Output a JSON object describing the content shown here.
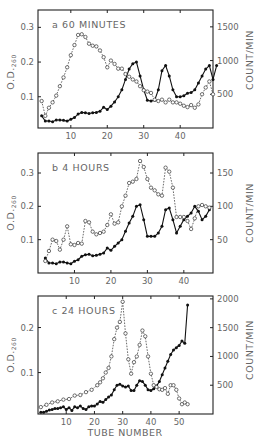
{
  "figure": {
    "x_axis_label": "TUBE NUMBER",
    "left_axis_label_main": "O.D.",
    "left_axis_label_sub": "260",
    "right_axis_label": "COUNT/MIN"
  },
  "chart_data": [
    {
      "type": "line",
      "panel": "a",
      "title": "a  60 MINUTES",
      "xlabel": "",
      "ylabel": "O.D.260",
      "y2label": "COUNT/MIN",
      "xlim": [
        1,
        49
      ],
      "ylim": [
        0.01,
        0.35
      ],
      "y2lim": [
        0,
        1750
      ],
      "x_ticks": [
        10,
        20,
        30,
        40
      ],
      "y_ticks": [
        0.1,
        0.2,
        0.3
      ],
      "y2_ticks": [
        500,
        1000,
        1500
      ],
      "series": [
        {
          "name": "O.D. 260 (filled circles, solid line)",
          "axis": "left",
          "style": "solid-filled",
          "x": [
            2,
            3,
            4,
            5,
            6,
            7,
            8,
            9,
            10,
            11,
            12,
            13,
            14,
            15,
            16,
            17,
            18,
            19,
            20,
            21,
            22,
            23,
            24,
            25,
            26,
            27,
            28,
            29,
            30,
            31,
            32,
            33,
            34,
            35,
            36,
            37,
            38,
            39,
            40,
            41,
            42,
            43,
            44,
            45,
            46,
            47,
            48,
            49,
            50
          ],
          "y": [
            0.045,
            0.03,
            0.03,
            0.028,
            0.033,
            0.033,
            0.032,
            0.03,
            0.035,
            0.04,
            0.05,
            0.055,
            0.054,
            0.052,
            0.054,
            0.055,
            0.058,
            0.07,
            0.063,
            0.073,
            0.085,
            0.1,
            0.12,
            0.15,
            0.18,
            0.195,
            0.2,
            0.16,
            0.12,
            0.09,
            0.088,
            0.09,
            0.12,
            0.175,
            0.19,
            0.16,
            0.12,
            0.1,
            0.1,
            0.103,
            0.11,
            0.112,
            0.12,
            0.14,
            0.16,
            0.18,
            0.19,
            0.15,
            0.19
          ]
        },
        {
          "name": "Count/min (open circles, dashed line)",
          "axis": "right",
          "style": "dashed-open",
          "x": [
            2,
            3,
            4,
            5,
            6,
            7,
            8,
            9,
            10,
            11,
            12,
            13,
            14,
            15,
            16,
            17,
            18,
            19,
            20,
            21,
            22,
            23,
            24,
            25,
            26,
            27,
            28,
            29,
            30,
            31,
            32,
            33,
            34,
            35,
            36,
            37,
            38,
            39,
            40,
            41,
            42,
            43,
            44,
            45,
            46,
            47,
            48,
            49
          ],
          "y": [
            400,
            180,
            300,
            380,
            480,
            620,
            750,
            900,
            1080,
            1230,
            1380,
            1390,
            1350,
            1250,
            1220,
            1210,
            1150,
            1050,
            900,
            1000,
            950,
            880,
            880,
            800,
            760,
            720,
            690,
            620,
            560,
            540,
            520,
            420,
            400,
            420,
            380,
            420,
            380,
            380,
            360,
            330,
            310,
            340,
            300,
            350,
            500,
            600,
            690,
            500
          ]
        }
      ]
    },
    {
      "type": "line",
      "panel": "b",
      "title": "b  4 HOURS",
      "xlabel": "",
      "ylabel": "O.D.260",
      "y2label": "COUNT/MIN",
      "xlim": [
        0,
        48
      ],
      "ylim": [
        0,
        0.36
      ],
      "y2lim": [
        0,
        180
      ],
      "x_ticks": [
        10,
        20,
        30,
        40
      ],
      "y_ticks": [
        0.1,
        0.2,
        0.3
      ],
      "y2_ticks": [
        50,
        100,
        150
      ],
      "series": [
        {
          "name": "O.D. 260 (filled circles, solid line)",
          "axis": "left",
          "style": "solid-filled",
          "x": [
            2,
            3,
            4,
            5,
            6,
            7,
            8,
            9,
            10,
            11,
            12,
            13,
            14,
            15,
            16,
            17,
            18,
            19,
            20,
            21,
            22,
            23,
            24,
            25,
            26,
            27,
            28,
            29,
            30,
            31,
            32,
            33,
            34,
            35,
            36,
            37,
            38,
            39,
            40,
            41,
            42,
            43,
            44,
            45,
            46,
            47
          ],
          "y": [
            0.045,
            0.03,
            0.03,
            0.028,
            0.033,
            0.033,
            0.03,
            0.028,
            0.035,
            0.04,
            0.05,
            0.055,
            0.056,
            0.052,
            0.053,
            0.056,
            0.06,
            0.075,
            0.068,
            0.08,
            0.09,
            0.1,
            0.125,
            0.15,
            0.17,
            0.2,
            0.205,
            0.16,
            0.11,
            0.11,
            0.11,
            0.12,
            0.14,
            0.19,
            0.195,
            0.16,
            0.12,
            0.14,
            0.16,
            0.17,
            0.18,
            0.2,
            0.185,
            0.16,
            0.17,
            0.19
          ]
        },
        {
          "name": "Count/min (open circles, dashed line)",
          "axis": "right",
          "style": "dashed-open",
          "x": [
            2,
            3,
            4,
            5,
            6,
            7,
            8,
            9,
            10,
            11,
            12,
            13,
            14,
            15,
            16,
            17,
            18,
            19,
            20,
            21,
            22,
            23,
            24,
            25,
            26,
            27,
            28,
            29,
            30,
            31,
            32,
            33,
            34,
            35,
            36,
            37,
            38,
            39,
            40,
            41,
            42,
            43,
            44,
            45,
            46,
            47
          ],
          "y": [
            18,
            33,
            50,
            48,
            35,
            50,
            70,
            43,
            42,
            45,
            44,
            78,
            76,
            62,
            58,
            60,
            62,
            72,
            88,
            74,
            76,
            100,
            116,
            135,
            137,
            141,
            168,
            159,
            141,
            128,
            124,
            118,
            116,
            158,
            152,
            128,
            84,
            84,
            84,
            78,
            66,
            82,
            100,
            102,
            100,
            98
          ]
        }
      ]
    },
    {
      "type": "line",
      "panel": "c",
      "title": "c  24 HOURS",
      "xlabel": "TUBE NUMBER",
      "ylabel": "O.D.260",
      "y2label": "COUNT/MIN",
      "xlim": [
        0,
        62
      ],
      "ylim": [
        0.008,
        0.27
      ],
      "y2lim": [
        0,
        2050
      ],
      "x_ticks": [
        10,
        20,
        30,
        40,
        50
      ],
      "y_ticks": [
        0.1,
        0.2
      ],
      "y2_ticks": [
        500,
        1000,
        1500,
        2000
      ],
      "series": [
        {
          "name": "O.D. 260 (filled circles, solid line)",
          "axis": "left",
          "style": "solid-filled",
          "x": [
            1,
            2,
            3,
            4,
            5,
            6,
            7,
            8,
            9,
            10,
            11,
            12,
            13,
            14,
            15,
            16,
            17,
            18,
            19,
            20,
            21,
            22,
            23,
            24,
            25,
            26,
            27,
            28,
            29,
            30,
            31,
            32,
            33,
            34,
            35,
            36,
            37,
            38,
            39,
            40,
            41,
            42,
            43,
            44,
            45,
            46,
            47,
            48,
            49,
            50,
            51,
            52,
            53
          ],
          "y": [
            0.012,
            0.012,
            0.014,
            0.017,
            0.018,
            0.02,
            0.02,
            0.022,
            0.024,
            0.018,
            0.022,
            0.016,
            0.024,
            0.022,
            0.026,
            0.02,
            0.018,
            0.024,
            0.026,
            0.026,
            0.03,
            0.036,
            0.034,
            0.04,
            0.046,
            0.05,
            0.062,
            0.072,
            0.074,
            0.07,
            0.068,
            0.07,
            0.06,
            0.06,
            0.072,
            0.082,
            0.08,
            0.072,
            0.062,
            0.06,
            0.064,
            0.07,
            0.08,
            0.095,
            0.11,
            0.125,
            0.14,
            0.15,
            0.155,
            0.16,
            0.17,
            0.165,
            0.25
          ]
        },
        {
          "name": "Count/min (open circles, dashed line)",
          "axis": "right",
          "style": "dashed-open",
          "x": [
            1,
            3,
            5,
            7,
            9,
            11,
            13,
            15,
            17,
            19,
            21,
            22,
            23,
            24,
            25,
            26,
            27,
            28,
            29,
            30,
            31,
            32,
            33,
            34,
            35,
            36,
            37,
            38,
            39,
            40,
            41,
            42,
            43,
            44,
            45,
            46,
            47,
            48,
            49,
            50,
            51,
            52,
            53
          ],
          "y": [
            120,
            160,
            200,
            220,
            250,
            260,
            320,
            330,
            380,
            420,
            500,
            550,
            620,
            720,
            800,
            1000,
            1300,
            1500,
            1600,
            1950,
            1400,
            950,
            700,
            900,
            1000,
            1200,
            1450,
            1350,
            1000,
            700,
            500,
            470,
            430,
            420,
            450,
            350,
            500,
            500,
            420,
            270,
            170,
            200,
            170
          ]
        }
      ]
    }
  ]
}
